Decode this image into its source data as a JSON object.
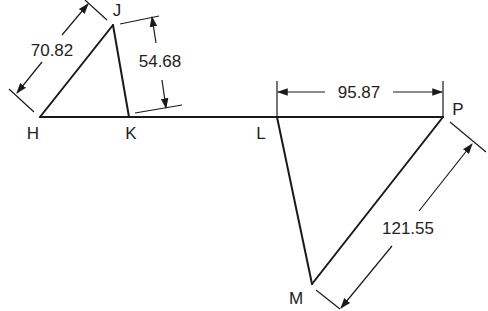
{
  "diagram": {
    "points": {
      "H": "H",
      "J": "J",
      "K": "K",
      "L": "L",
      "M": "M",
      "P": "P"
    },
    "dimensions": {
      "HJ": "70.82",
      "JK_height": "54.68",
      "LP": "95.87",
      "PM": "121.55"
    },
    "colors": {
      "line": "#1a1a1a",
      "text": "#222222",
      "background": "#ffffff"
    }
  }
}
